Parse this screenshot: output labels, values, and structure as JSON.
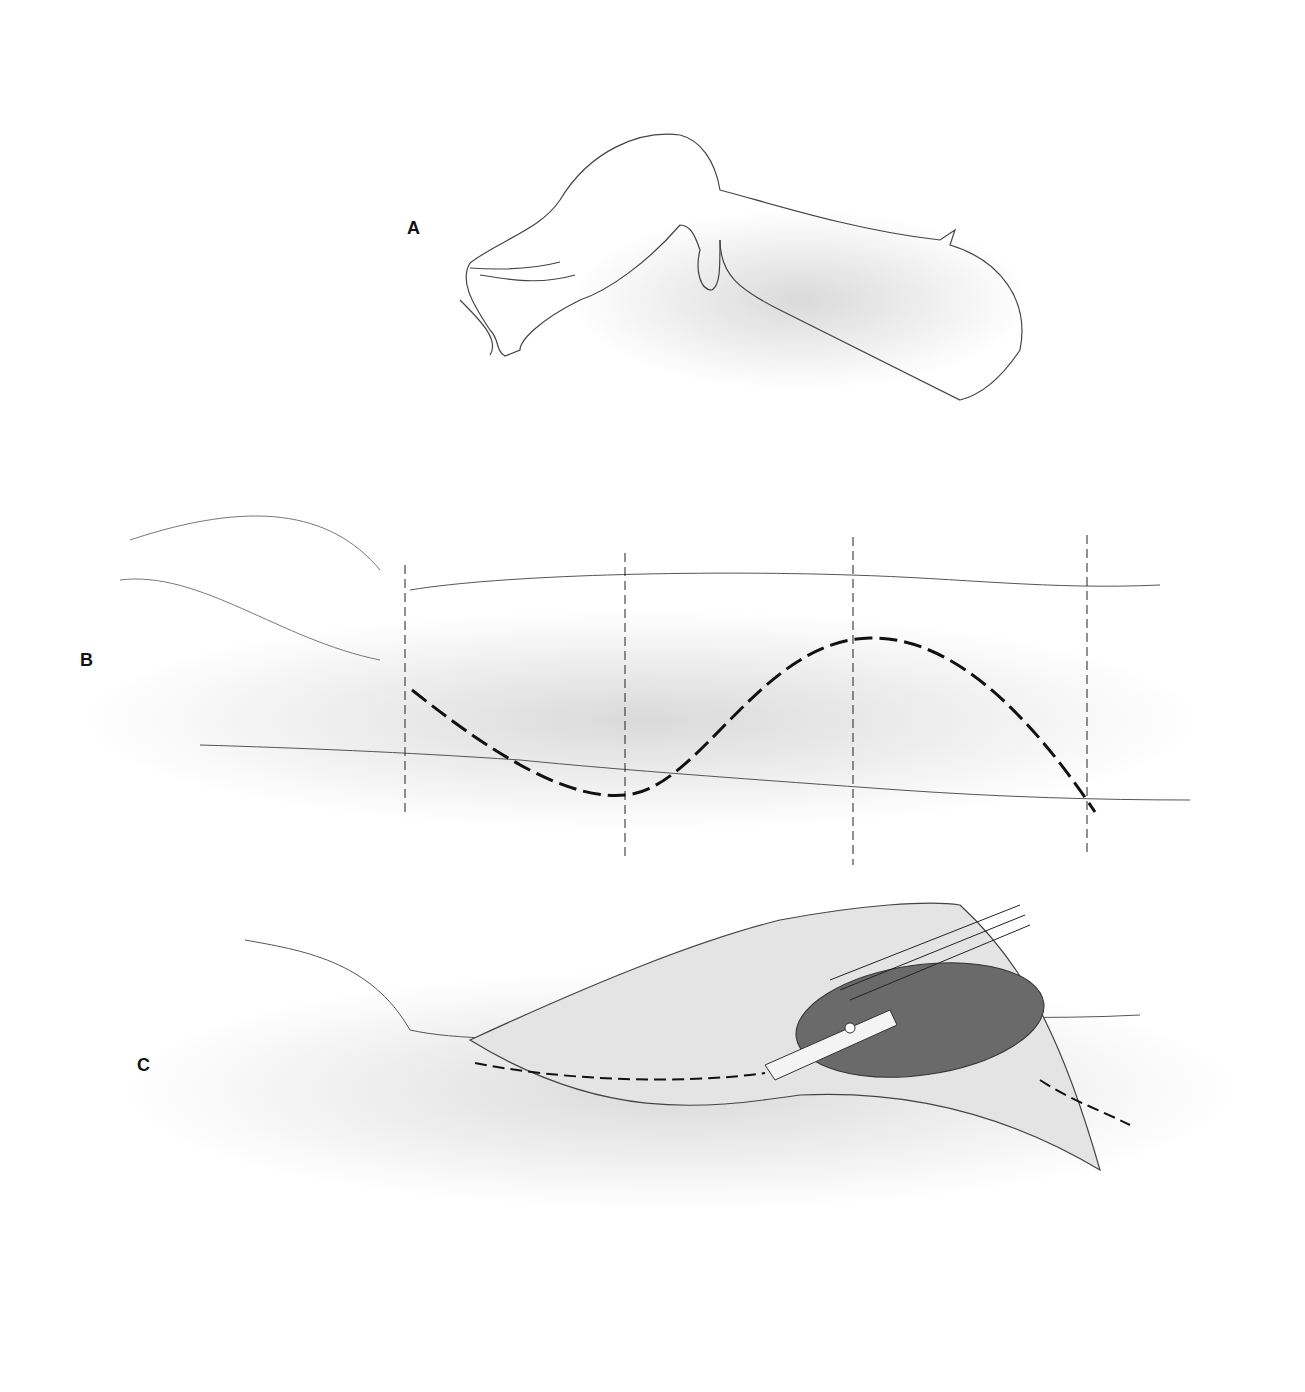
{
  "figure": {
    "panels": [
      {
        "label": "A",
        "description": "Hand with wrist drop"
      },
      {
        "label": "B",
        "description": "Forearm with S-shaped dashed incision and four vertical dashed reference lines"
      },
      {
        "label": "C",
        "description": "Forearm with opened incision exposing muscle, retractor, and dashed nerve course"
      }
    ],
    "colors": {
      "line": "#333333",
      "shade": "#b8b8b8",
      "muscle": "#555555"
    }
  }
}
